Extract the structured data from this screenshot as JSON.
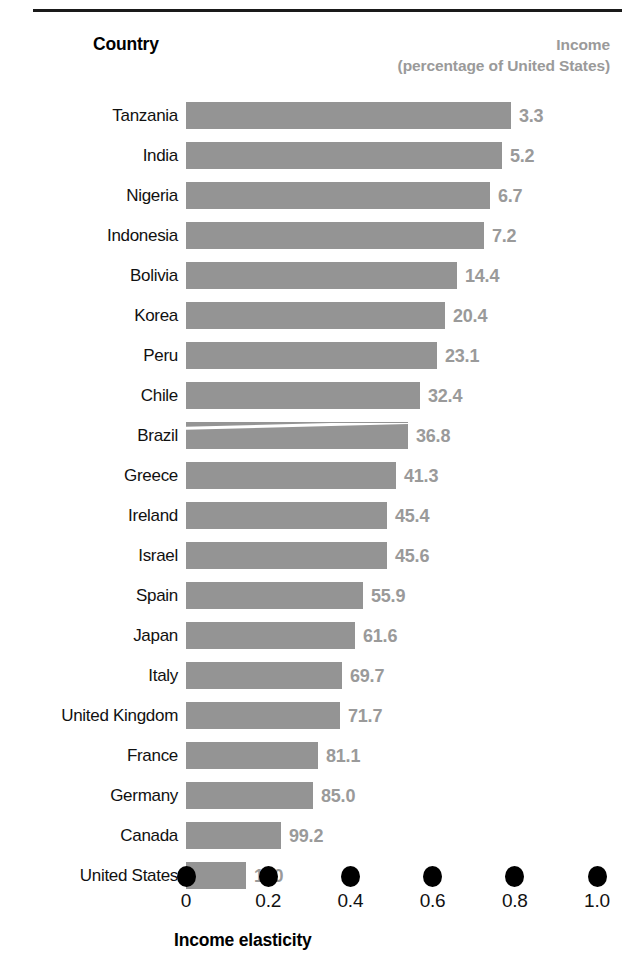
{
  "header": {
    "country_label": "Country",
    "income_label": "Income",
    "income_sublabel": "(percentage of United States)"
  },
  "axis": {
    "title": "Income elasticity",
    "tick_labels": [
      "0",
      "0.2",
      "0.4",
      "0.6",
      "0.8",
      "1.0"
    ]
  },
  "colors": {
    "bar": "#949494",
    "value_text": "#9a9a9a",
    "label_text": "#111111",
    "rule": "#1a1a1a",
    "dot": "#000000"
  },
  "chart_data": {
    "type": "bar",
    "orientation": "horizontal",
    "title": "",
    "xlabel": "Income elasticity",
    "ylabel": "Country",
    "xlim": [
      0,
      1.0
    ],
    "xticks": [
      0,
      0.2,
      0.4,
      0.6,
      0.8,
      1.0
    ],
    "grid": false,
    "legend": false,
    "value_label_header": "Income (percentage of United States)",
    "categories": [
      "Tanzania",
      "India",
      "Nigeria",
      "Indonesia",
      "Bolivia",
      "Korea",
      "Peru",
      "Chile",
      "Brazil",
      "Greece",
      "Ireland",
      "Israel",
      "Spain",
      "Japan",
      "Italy",
      "United Kingdom",
      "France",
      "Germany",
      "Canada",
      "United States"
    ],
    "values": [
      0.79,
      0.77,
      0.74,
      0.725,
      0.66,
      0.63,
      0.61,
      0.57,
      0.54,
      0.51,
      0.49,
      0.49,
      0.43,
      0.41,
      0.38,
      0.375,
      0.32,
      0.31,
      0.23,
      0.146
    ],
    "value_labels": [
      "3.3",
      "5.2",
      "6.7",
      "7.2",
      "14.4",
      "20.4",
      "23.1",
      "32.4",
      "36.8",
      "41.3",
      "45.4",
      "45.6",
      "55.9",
      "61.6",
      "69.7",
      "71.7",
      "81.1",
      "85.0",
      "99.2",
      "100"
    ],
    "series": [
      {
        "name": "Income elasticity",
        "values": [
          0.79,
          0.77,
          0.74,
          0.725,
          0.66,
          0.63,
          0.61,
          0.57,
          0.54,
          0.51,
          0.49,
          0.49,
          0.43,
          0.41,
          0.38,
          0.375,
          0.32,
          0.31,
          0.23,
          0.146
        ]
      },
      {
        "name": "Income (percentage of United States)",
        "values": [
          3.3,
          5.2,
          6.7,
          7.2,
          14.4,
          20.4,
          23.1,
          32.4,
          36.8,
          41.3,
          45.4,
          45.6,
          55.9,
          61.6,
          69.7,
          71.7,
          81.1,
          85.0,
          99.2,
          100
        ]
      }
    ],
    "annotations": [
      {
        "category": "Brazil",
        "note": "white scan-line artifact across bar"
      }
    ]
  }
}
